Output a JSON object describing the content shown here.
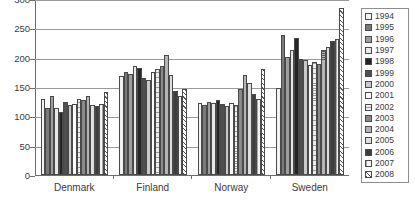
{
  "chart_data": {
    "type": "bar",
    "title": "",
    "subtitle": "",
    "xlabel": "",
    "ylabel": "",
    "ylim": [
      0,
      300
    ],
    "ytick_labels": [
      "300",
      "250",
      "200",
      "150",
      "100",
      "50",
      "0"
    ],
    "ytick_values": [
      300,
      250,
      200,
      150,
      100,
      50,
      0
    ],
    "grid": true,
    "legend_position": "right",
    "categories": [
      "Denmark",
      "Finland",
      "Norway",
      "Sweden"
    ],
    "series": [
      {
        "name": "1994",
        "fill": "p-hthin",
        "values": [
          129,
          168,
          122,
          148
        ]
      },
      {
        "name": "1995",
        "fill": "p-vdark",
        "values": [
          114,
          175,
          119,
          238
        ]
      },
      {
        "name": "1996",
        "fill": "p-gray",
        "values": [
          134,
          172,
          124,
          201
        ]
      },
      {
        "name": "1997",
        "fill": "p-light",
        "values": [
          114,
          185,
          122,
          213
        ]
      },
      {
        "name": "1998",
        "fill": "p-black",
        "values": [
          108,
          182,
          128,
          234
        ]
      },
      {
        "name": "1999",
        "fill": "p-dkgray",
        "values": [
          125,
          165,
          121,
          198
        ]
      },
      {
        "name": "2000",
        "fill": "p-vmid",
        "values": [
          120,
          162,
          117,
          196
        ]
      },
      {
        "name": "2001",
        "fill": "p-white",
        "values": [
          121,
          175,
          123,
          188
        ]
      },
      {
        "name": "2002",
        "fill": "p-hlight",
        "values": [
          130,
          180,
          120,
          192
        ]
      },
      {
        "name": "2003",
        "fill": "p-mgray",
        "values": [
          128,
          186,
          146,
          189
        ]
      },
      {
        "name": "2004",
        "fill": "p-checker",
        "values": [
          134,
          204,
          171,
          213
        ]
      },
      {
        "name": "2005",
        "fill": "p-pale",
        "values": [
          120,
          171,
          156,
          218
        ]
      },
      {
        "name": "2006",
        "fill": "p-chargray",
        "values": [
          118,
          144,
          138,
          229
        ]
      },
      {
        "name": "2007",
        "fill": "p-vpale",
        "values": [
          121,
          135,
          130,
          231
        ]
      },
      {
        "name": "2008",
        "fill": "p-diag",
        "values": [
          141,
          147,
          180,
          285
        ]
      }
    ]
  },
  "legend": {
    "items": [
      {
        "year": "1994"
      },
      {
        "year": "1995"
      },
      {
        "year": "1996"
      },
      {
        "year": "1997"
      },
      {
        "year": "1998"
      },
      {
        "year": "1999"
      },
      {
        "year": "2000"
      },
      {
        "year": "2001"
      },
      {
        "year": "2002"
      },
      {
        "year": "2003"
      },
      {
        "year": "2004"
      },
      {
        "year": "2005"
      },
      {
        "year": "2006"
      },
      {
        "year": "2007"
      },
      {
        "year": "2008"
      }
    ]
  },
  "caption": {
    "text": ""
  }
}
